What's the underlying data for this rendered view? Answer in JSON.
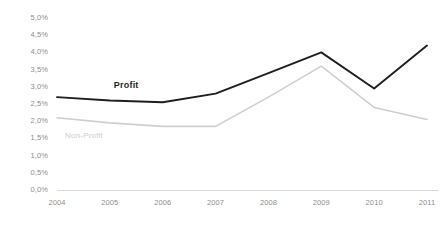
{
  "chart_data": {
    "type": "line",
    "title": "",
    "subtitle": "",
    "xlabel": "",
    "ylabel": "",
    "categories": [
      "2004",
      "2005",
      "2006",
      "2007",
      "2008",
      "2009",
      "2010",
      "2011"
    ],
    "series": [
      {
        "name": "Profit",
        "color": "#1f1f1f",
        "values": [
          2.7,
          2.6,
          2.55,
          2.8,
          3.4,
          4.0,
          2.95,
          4.2
        ],
        "label_text": "Profit"
      },
      {
        "name": "Non-Profit",
        "color": "#cfcfcf",
        "values": [
          2.1,
          1.95,
          1.85,
          1.85,
          2.7,
          3.6,
          2.4,
          2.05
        ],
        "label_text": "Non-Profit"
      }
    ],
    "ylim": [
      0.0,
      5.0
    ],
    "ytick_values": [
      0.0,
      0.5,
      1.0,
      1.5,
      2.0,
      2.5,
      3.0,
      3.5,
      4.0,
      4.5,
      5.0
    ],
    "ytick_labels": [
      "0,0%",
      "0,5%",
      "1,0%",
      "1,5%",
      "2,0%",
      "2,5%",
      "3,0%",
      "3,5%",
      "4,0%",
      "4,5%",
      "5,0%"
    ],
    "xtick_labels": [
      "2004",
      "2005",
      "2006",
      "2007",
      "2008",
      "2009",
      "2010",
      "2011"
    ],
    "grid": false,
    "legend": "inline-labels",
    "legend_position": "inline",
    "axis_line_color": "#d9d9d9",
    "tick_text_color": "#8d8d8d"
  },
  "axis": {
    "y_labels": [
      "5,0%",
      "4,5%",
      "4,0%",
      "3,5%",
      "3,0%",
      "2,5%",
      "2,0%",
      "1,5%",
      "1,0%",
      "0,5%",
      "0,0%"
    ],
    "x_labels": [
      "2004",
      "2005",
      "2006",
      "2007",
      "2008",
      "2009",
      "2010",
      "2011"
    ]
  },
  "labels": {
    "profit": "Profit",
    "non_profit": "Non-Profit"
  },
  "caption": {
    "text": ""
  },
  "colors": {
    "profit_line": "#1f1f1f",
    "non_profit_line": "#cfcfcf",
    "axis_line": "#d9d9d9",
    "tick_text": "#8d8d8d",
    "background": "#ffffff"
  }
}
